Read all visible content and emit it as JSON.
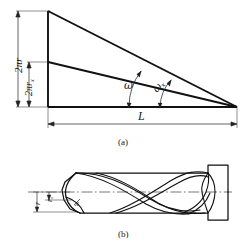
{
  "figure": {
    "title_a": "(a)",
    "title_b": "(b)",
    "panel_a": {
      "label_outer_radius": "2πr",
      "label_inner_radius_main": "2πr",
      "label_inner_radius_sub": "x",
      "label_length": "L",
      "label_angle_outer": "ω",
      "label_angle_inner_main": "ω",
      "label_angle_inner_sub": "x"
    },
    "panel_b": {
      "label_radius_outer": "r",
      "label_radius_inner_main": "r",
      "label_radius_inner_sub": "x",
      "label_point": "x"
    }
  },
  "colors": {
    "line": "#1a1a1a",
    "thin_line": "#333333",
    "background": "#ffffff",
    "centerline": "#555555"
  }
}
